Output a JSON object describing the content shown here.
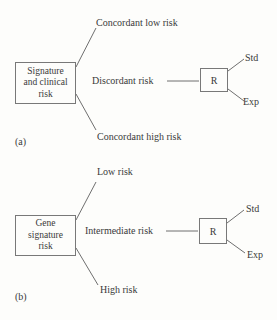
{
  "panels": {
    "a": {
      "label": "(a)",
      "root_lines": [
        "Signature",
        "and clinical",
        "risk"
      ],
      "branches": [
        "Concordant low risk",
        "Discordant risk",
        "Concordant high risk"
      ],
      "node": "R",
      "arms": [
        "Std",
        "Exp"
      ]
    },
    "b": {
      "label": "(b)",
      "root_lines": [
        "Gene",
        "signature",
        "risk"
      ],
      "branches": [
        "Low risk",
        "Intermediate risk",
        "High risk"
      ],
      "node": "R",
      "arms": [
        "Std",
        "Exp"
      ]
    }
  },
  "colors": {
    "line": "#6f6f6f",
    "text": "#3a3a3a",
    "background": "#fdfdfb"
  }
}
